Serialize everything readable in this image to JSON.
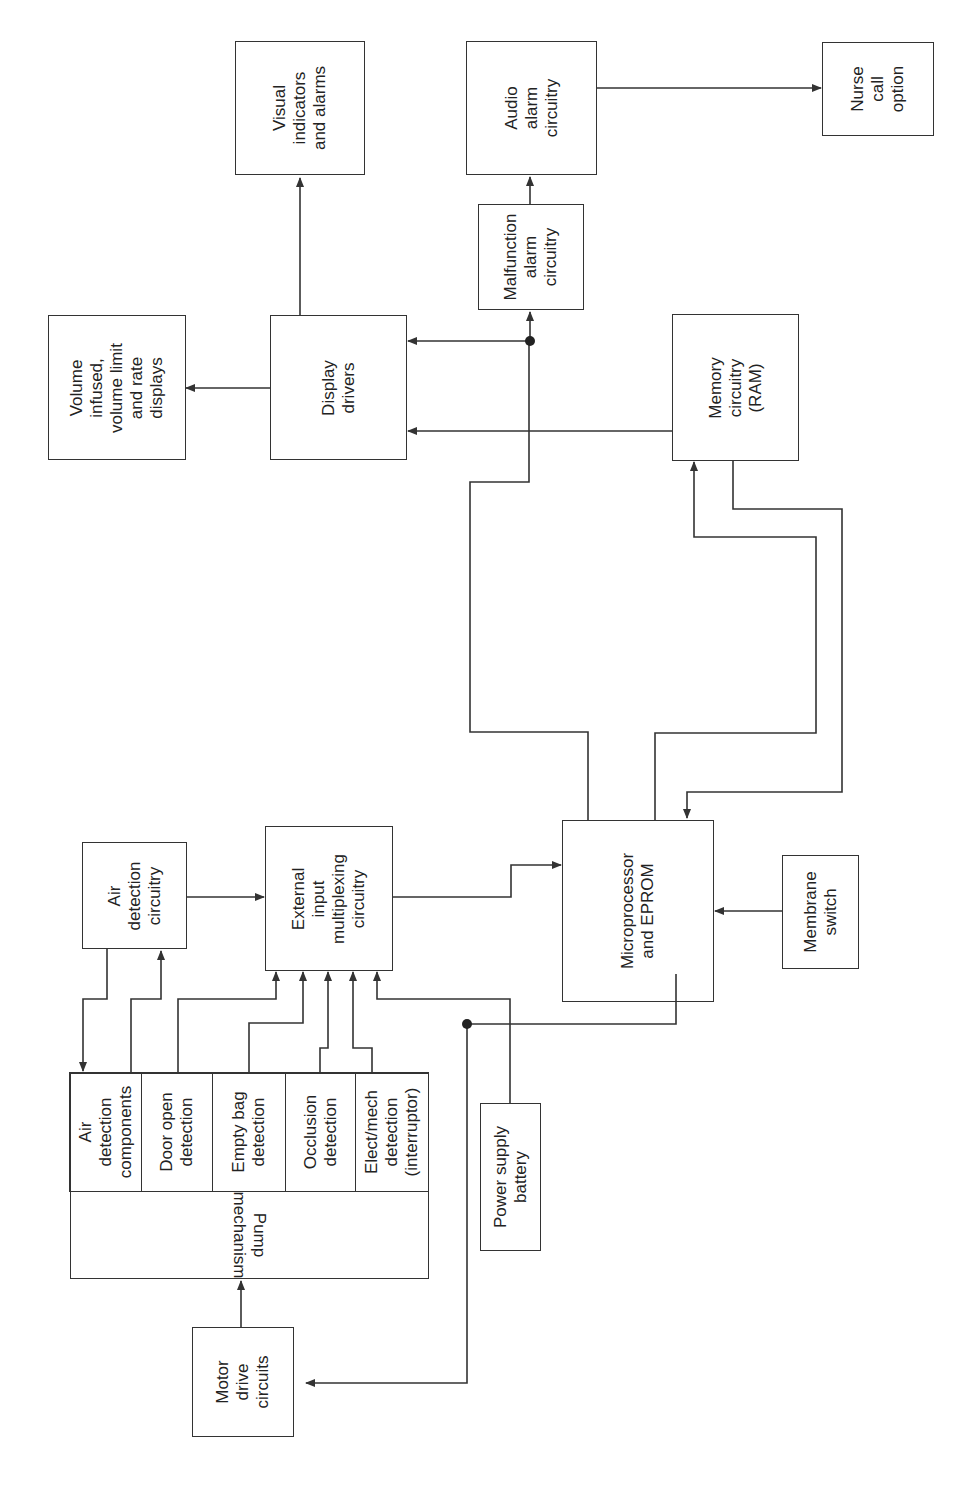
{
  "diagram": {
    "orientation": "rotated 90 degrees counter-clockwise",
    "blocks": {
      "visual_indicators": "Visual\nindicators\nand alarms",
      "audio_alarm": "Audio\nalarm\ncircuitry",
      "nurse_call": "Nurse\ncall\noption",
      "volume_displays": "Volume\ninfused,\nvolume limit\nand rate\ndisplays",
      "display_drivers": "Display\ndrivers",
      "malfunction_alarm": "Malfunction\nalarm\ncircuitry",
      "memory": "Memory\ncircuitry\n(RAM)",
      "air_detection_circuitry": "Air\ndetection\ncircuitry",
      "external_input": "External\ninput\nmultiplexing\ncircuitry",
      "microprocessor": "Microprocessor\nand EPROM",
      "membrane_switch": "Membrane\nswitch",
      "power_supply": "Power supply\nbattery",
      "motor_drive": "Motor\ndrive\ncircuits",
      "pump_mechanism": "Pump\nmechanism",
      "sensors": [
        "Air\ndetection\ncomponents",
        "Door open\ndetection",
        "Empty bag\ndetection",
        "Occlusion\ndetection",
        "Elect/mech\ndetection\n(interruptor)"
      ]
    },
    "connections": [
      {
        "from": "Display drivers",
        "to": "Visual indicators and alarms"
      },
      {
        "from": "Display drivers",
        "to": "Volume infused, volume limit and rate displays"
      },
      {
        "from": "Audio alarm circuitry",
        "to": "Nurse call option"
      },
      {
        "from": "Malfunction alarm circuitry",
        "to": "Audio alarm circuitry"
      },
      {
        "from": "Microprocessor and EPROM",
        "to": "Malfunction alarm circuitry"
      },
      {
        "from": "Microprocessor and EPROM",
        "to": "Display drivers"
      },
      {
        "from": "Memory circuitry (RAM)",
        "to": "Display drivers"
      },
      {
        "from": "Microprocessor and EPROM",
        "to": "Memory circuitry (RAM)"
      },
      {
        "from": "Memory circuitry (RAM)",
        "to": "Microprocessor and EPROM"
      },
      {
        "from": "Air detection circuitry",
        "to": "External input multiplexing circuitry"
      },
      {
        "from": "Air detection circuitry",
        "to": "Air detection components"
      },
      {
        "from": "Air detection components",
        "to": "Air detection circuitry"
      },
      {
        "from": "Door open detection",
        "to": "External input multiplexing circuitry"
      },
      {
        "from": "Empty bag detection",
        "to": "External input multiplexing circuitry"
      },
      {
        "from": "Occlusion detection",
        "to": "External input multiplexing circuitry"
      },
      {
        "from": "Elect/mech detection (interruptor)",
        "to": "External input multiplexing circuitry"
      },
      {
        "from": "Power supply battery",
        "to": "External input multiplexing circuitry"
      },
      {
        "from": "External input multiplexing circuitry",
        "to": "Microprocessor and EPROM"
      },
      {
        "from": "Membrane switch",
        "to": "Microprocessor and EPROM"
      },
      {
        "from": "Microprocessor and EPROM",
        "to": "Motor drive circuits"
      },
      {
        "from": "Motor drive circuits",
        "to": "Pump mechanism"
      }
    ]
  }
}
